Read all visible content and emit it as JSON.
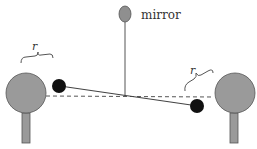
{
  "diagram": {
    "labels": {
      "mirror": "mirror",
      "r_left": "r",
      "r_right": "r"
    },
    "colors": {
      "large_sphere": "#9a9a9a",
      "small_sphere": "#111111",
      "mirror": "#8f8f8f",
      "stand": "#9a9a9a",
      "line": "#444444",
      "dashed": "#555555"
    },
    "components": [
      {
        "id": "mirror",
        "type": "ellipse"
      },
      {
        "id": "fiber",
        "type": "line"
      },
      {
        "id": "rod",
        "type": "line"
      },
      {
        "id": "large-sphere-left",
        "type": "circle"
      },
      {
        "id": "large-sphere-right",
        "type": "circle"
      },
      {
        "id": "small-sphere-left",
        "type": "circle"
      },
      {
        "id": "small-sphere-right",
        "type": "circle"
      },
      {
        "id": "equilibrium-line",
        "type": "dashed-line"
      },
      {
        "id": "distance-brace-left",
        "label": "r"
      },
      {
        "id": "distance-brace-right",
        "label": "r"
      }
    ]
  }
}
